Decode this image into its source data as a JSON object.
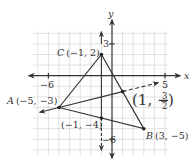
{
  "diagram": {
    "axes": {
      "x_label": "x",
      "y_label": "y"
    },
    "ticks": {
      "x_neg": "−6",
      "x_pos": "5",
      "y_pos": "3",
      "y_neg": "−6"
    },
    "points": {
      "A": {
        "name": "A",
        "coords": "(−5, −3)",
        "x": -5,
        "y": -3
      },
      "B": {
        "name": "B",
        "coords": "(3, −5)",
        "x": 3,
        "y": -5
      },
      "C": {
        "name": "C",
        "coords": "(−1, 2)",
        "x": -1,
        "y": 2
      },
      "D": {
        "coords": "(−1, −4)",
        "x": -1,
        "y": -4
      },
      "M": {
        "coords_open": "(1, −",
        "num": "3",
        "den": "2",
        "coords_close": ")",
        "x": 1,
        "y": -1.5
      }
    },
    "colors": {
      "line": "#333333",
      "grid": "#d4d4d4"
    }
  }
}
